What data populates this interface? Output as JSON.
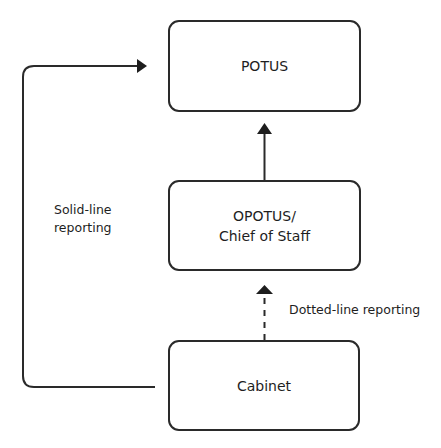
{
  "diagram": {
    "nodes": [
      {
        "id": "potus",
        "lines": [
          "POTUS"
        ]
      },
      {
        "id": "opotus",
        "lines": [
          "OPOTUS/",
          "Chief of Staff"
        ]
      },
      {
        "id": "cabinet",
        "lines": [
          "Cabinet"
        ]
      }
    ],
    "edges": [
      {
        "from": "opotus",
        "to": "potus",
        "style": "solid"
      },
      {
        "from": "cabinet",
        "to": "opotus",
        "style": "dashed"
      },
      {
        "from": "cabinet",
        "to": "potus",
        "style": "solid",
        "route": "left-loop"
      }
    ],
    "labels": {
      "solid_line": [
        "Solid-line",
        "reporting"
      ],
      "dotted_line": "Dotted-line reporting"
    },
    "colors": {
      "stroke": "#2a2a2a",
      "text": "#1e1e1e",
      "background": "#ffffff"
    }
  }
}
